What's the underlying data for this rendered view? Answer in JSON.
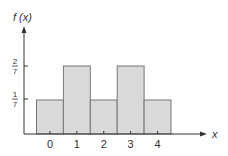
{
  "chart_data": {
    "type": "bar",
    "title": "",
    "xlabel": "x",
    "ylabel": "f (x)",
    "categories": [
      "0",
      "1",
      "2",
      "3",
      "4"
    ],
    "values": [
      0.142857,
      0.285714,
      0.142857,
      0.285714,
      0.142857
    ],
    "values_fraction": [
      "1/7",
      "2/7",
      "1/7",
      "2/7",
      "1/7"
    ],
    "y_ticks": [
      {
        "value": 0.142857,
        "num": "1",
        "den": "7"
      },
      {
        "value": 0.285714,
        "num": "2",
        "den": "7"
      }
    ],
    "ylim": [
      0,
      0.43
    ],
    "grid": false,
    "legend": null,
    "bar_fill": "#d9d9d9",
    "bar_edge": "#777777",
    "axis_color": "#333333"
  },
  "labels": {
    "y_axis": "f (x)",
    "x_axis": "x",
    "ticks": [
      "0",
      "1",
      "2",
      "3",
      "4"
    ],
    "ytick1_num": "1",
    "ytick1_den": "7",
    "ytick2_num": "2",
    "ytick2_den": "7"
  }
}
